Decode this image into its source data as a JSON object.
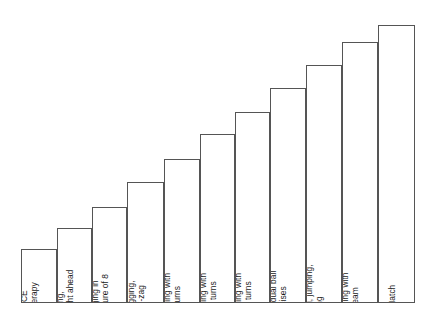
{
  "figure": {
    "background_color": "#ffffff",
    "bar_fill_color": "#ffffff",
    "bar_stroke_color": "#555555",
    "label_color": "#1a1a1a"
  },
  "chart_data": {
    "type": "bar",
    "title": "",
    "subtitle": "",
    "xlabel": "",
    "ylabel": "",
    "grid": false,
    "legend": null,
    "axis_visible": false,
    "orientation": "vertical",
    "label_rotation_degrees": -90,
    "label_placement": "inside-bar-bottom",
    "ylim": [
      0,
      11
    ],
    "categories": [
      "RICE therapy",
      "Jogging, straight ahead",
      "Jogging in a figure of 8",
      "Jogging, zig-zag",
      "Jogging with 90° turns",
      "Jogging with 180° turns",
      "Jogging with 360° turns",
      "Individual ball exercises",
      "Kicking, jumping, sprinting",
      "Training with the team",
      "Match"
    ],
    "values": [
      1,
      2,
      3,
      4,
      5,
      6,
      7,
      8,
      9,
      10,
      11
    ],
    "bars": [
      {
        "index": 1,
        "label": "RICE therapy",
        "label_lines": [
          "RICE",
          "therapy"
        ],
        "value": 1,
        "x": 21,
        "width": 36,
        "top": 249,
        "height": 54
      },
      {
        "index": 2,
        "label": "Jogging, straight ahead",
        "label_lines": [
          "Jogging,",
          "straight ahead"
        ],
        "value": 2,
        "x": 57,
        "width": 35,
        "top": 228,
        "height": 75
      },
      {
        "index": 3,
        "label": "Jogging in a figure of 8",
        "label_lines": [
          "Jogging in",
          "a figure of 8"
        ],
        "value": 3,
        "x": 92,
        "width": 35,
        "top": 207,
        "height": 96
      },
      {
        "index": 4,
        "label": "Jogging, zig-zag",
        "label_lines": [
          "Jogging,",
          "zig-zag"
        ],
        "value": 4,
        "x": 127,
        "width": 37,
        "top": 182,
        "height": 121
      },
      {
        "index": 5,
        "label": "Jogging with 90° turns",
        "label_lines": [
          "Jogging with",
          "90° turns"
        ],
        "value": 5,
        "x": 164,
        "width": 36,
        "top": 159,
        "height": 144
      },
      {
        "index": 6,
        "label": "Jogging with 180° turns",
        "label_lines": [
          "Jogging with",
          "180° turns"
        ],
        "value": 6,
        "x": 200,
        "width": 35,
        "top": 134,
        "height": 169
      },
      {
        "index": 7,
        "label": "Jogging with 360° turns",
        "label_lines": [
          "Jogging with",
          "360° turns"
        ],
        "value": 7,
        "x": 235,
        "width": 35,
        "top": 112,
        "height": 191
      },
      {
        "index": 8,
        "label": "Individual ball exercises",
        "label_lines": [
          "Individual ball",
          "exercises"
        ],
        "value": 8,
        "x": 270,
        "width": 36,
        "top": 88,
        "height": 215
      },
      {
        "index": 9,
        "label": "Kicking, jumping, sprinting",
        "label_lines": [
          "Kicking, jumping,",
          "sprinting"
        ],
        "value": 9,
        "x": 306,
        "width": 36,
        "top": 65,
        "height": 238
      },
      {
        "index": 10,
        "label": "Training with the team",
        "label_lines": [
          "Training with",
          "the team"
        ],
        "value": 10,
        "x": 342,
        "width": 36,
        "top": 42,
        "height": 261
      },
      {
        "index": 11,
        "label": "Match",
        "label_lines": [
          "Match"
        ],
        "value": 11,
        "x": 378,
        "width": 37,
        "top": 25,
        "height": 278
      }
    ]
  }
}
